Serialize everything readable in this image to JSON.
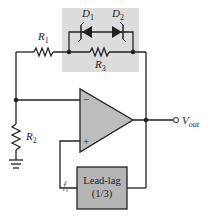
{
  "diagram": {
    "type": "Wien-bridge oscillator with diode gain stabilization",
    "components": {
      "R1": {
        "label": "R",
        "sub": "1"
      },
      "R2": {
        "label": "R",
        "sub": "2"
      },
      "R3": {
        "label": "R",
        "sub": "3"
      },
      "D1": {
        "label": "D",
        "sub": "1"
      },
      "D2": {
        "label": "D",
        "sub": "2"
      },
      "opamp": {
        "minus": "−",
        "plus": "+"
      },
      "leadlag": {
        "title": "Lead-lag",
        "ratio": "(1/3)"
      },
      "fr": {
        "label": "f",
        "sub": "r"
      },
      "vout": {
        "label": "V",
        "sub": "out"
      }
    },
    "colors": {
      "shade": "#d8d8d8",
      "opamp_fill": "#bdbdbd",
      "box_fill": "#b5b5b5",
      "wire": "#222222"
    }
  }
}
